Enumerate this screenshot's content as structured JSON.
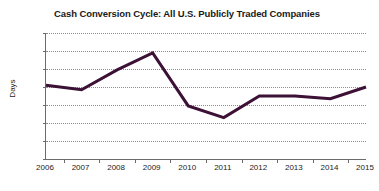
{
  "chart_data": {
    "type": "line",
    "title": "Cash Conversion Cycle: All U.S. Publicly Traded Companies",
    "xlabel": "",
    "ylabel": "Days",
    "categories": [
      "2006",
      "2007",
      "2008",
      "2009",
      "2010",
      "2011",
      "2012",
      "2013",
      "2014",
      "2015"
    ],
    "values": [
      62.2,
      61.7,
      63.9,
      65.8,
      59.9,
      58.6,
      61.0,
      61.0,
      60.7,
      62.0
    ],
    "series": [
      {
        "name": "Cash Conversion Cycle",
        "values": [
          62.2,
          61.7,
          63.9,
          65.8,
          59.9,
          58.6,
          61.0,
          61.0,
          60.7,
          62.0
        ]
      }
    ],
    "ylim": [
      54,
      68
    ],
    "ytick_step": 2,
    "yticks": [
      68,
      66,
      64,
      62,
      60,
      58,
      56,
      54
    ],
    "grid": "horizontal-dotted",
    "legend": "none",
    "line_color": "#3d1036",
    "gridline_color": "#8d8d8d",
    "axis_color": "#6b6b6b",
    "background_color": "#ffffff"
  }
}
